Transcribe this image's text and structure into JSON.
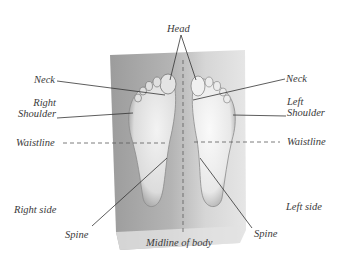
{
  "diagram": {
    "labels": {
      "head": "Head",
      "neck_left_side": "Neck",
      "neck_right_side": "Neck",
      "right_shoulder_line1": "Right",
      "right_shoulder_line2": "Shoulder",
      "left_shoulder_line1": "Left",
      "left_shoulder_line2": "Shoulder",
      "waistline_left": "Waistline",
      "waistline_right": "Waistline",
      "right_side": "Right side",
      "left_side": "Left side",
      "spine_left": "Spine",
      "spine_right": "Spine",
      "midline": "Midline of body"
    },
    "colors": {
      "board": "#a9a9a9",
      "board_light": "#d9d9d9",
      "foot": "#ececec",
      "foot_shadow": "#7a7a7a",
      "line": "#3a3a3a",
      "text": "#3a3a3a"
    }
  }
}
